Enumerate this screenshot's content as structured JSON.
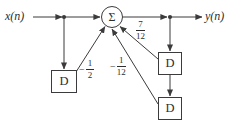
{
  "diagram": {
    "input_label": "x(n)",
    "output_label": "y(n)",
    "summation_symbol": "Σ",
    "delay_blocks": [
      {
        "label": "D"
      },
      {
        "label": "D"
      },
      {
        "label": "D"
      }
    ],
    "coefficients": {
      "input_delay_path": {
        "sign": "−",
        "numerator": "1",
        "denominator": "2"
      },
      "output_delay2_path": {
        "sign": "−",
        "numerator": "1",
        "denominator": "12"
      },
      "output_delay1_path": {
        "sign": "",
        "numerator": "7",
        "denominator": "12"
      }
    },
    "colors": {
      "line": "#3b3b3b",
      "background": "#ffffff",
      "text": "#2e2e2e"
    }
  }
}
